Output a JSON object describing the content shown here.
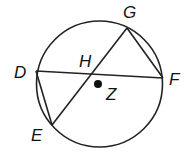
{
  "diagram": {
    "type": "circle-geometry",
    "circle": {
      "name": "Z",
      "cx": 99.5,
      "cy": 84,
      "r": 63
    },
    "points": {
      "G": {
        "label": "G",
        "x": 127,
        "y": 28,
        "label_x": 123,
        "label_y": 18
      },
      "D": {
        "label": "D",
        "x": 36,
        "y": 71,
        "label_x": 14,
        "label_y": 78
      },
      "F": {
        "label": "F",
        "x": 163,
        "y": 78,
        "label_x": 169,
        "label_y": 85
      },
      "E": {
        "label": "E",
        "x": 52,
        "y": 125,
        "label_x": 31,
        "label_y": 141
      },
      "H": {
        "label": "H",
        "x": 92,
        "y": 74,
        "label_x": 79,
        "label_y": 67
      },
      "Z": {
        "label": "Z",
        "x": 98,
        "y": 84,
        "label_x": 106,
        "label_y": 100
      }
    },
    "segments": [
      {
        "name": "chord-DF",
        "from": "D",
        "to": "F"
      },
      {
        "name": "chord-GE",
        "from": "G",
        "to": "E"
      },
      {
        "name": "chord-GF",
        "from": "G",
        "to": "F"
      },
      {
        "name": "chord-DE",
        "from": "D",
        "to": "E"
      }
    ],
    "colors": {
      "stroke": "#222222",
      "text": "#111111",
      "background": "#ffffff"
    }
  }
}
